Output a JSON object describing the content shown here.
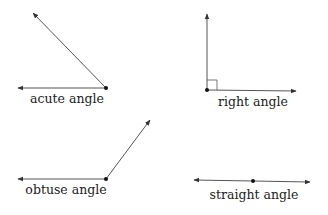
{
  "diagram": {
    "colors": {
      "line": "#555555",
      "vertex": "#111111",
      "text": "#222222"
    },
    "angles": [
      {
        "id": "acute",
        "label": "acute angle",
        "vertex": [
          106,
          88
        ],
        "rays": [
          [
            33,
            13
          ],
          [
            18,
            88
          ]
        ],
        "label_pos": [
          67,
          93
        ]
      },
      {
        "id": "right",
        "label": "right angle",
        "vertex": [
          207,
          90
        ],
        "rays": [
          [
            207,
            14
          ],
          [
            296,
            91
          ]
        ],
        "right_angle_marker": true,
        "label_pos": [
          253,
          96
        ]
      },
      {
        "id": "obtuse",
        "label": "obtuse angle",
        "vertex": [
          106,
          179
        ],
        "rays": [
          [
            18,
            179
          ],
          [
            150,
            120
          ]
        ],
        "label_pos": [
          66,
          184
        ]
      },
      {
        "id": "straight",
        "label": "straight angle",
        "vertex": [
          253,
          181
        ],
        "rays": [
          [
            194,
            180
          ],
          [
            310,
            182
          ]
        ],
        "label_pos": [
          254,
          189
        ]
      }
    ]
  }
}
